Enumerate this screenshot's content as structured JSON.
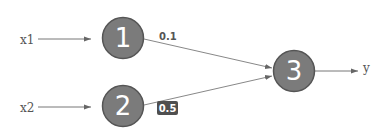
{
  "diagram": {
    "type": "neural-network",
    "colors": {
      "node_fill": "#7b7b7b",
      "node_stroke": "#555555",
      "edge": "#777777",
      "badge_bg": "#4f4f4f",
      "text": "#555555"
    },
    "inputs": [
      {
        "id": "x1",
        "label": "x1"
      },
      {
        "id": "x2",
        "label": "x2"
      }
    ],
    "nodes": [
      {
        "id": "n1",
        "label": "1"
      },
      {
        "id": "n2",
        "label": "2"
      },
      {
        "id": "n3",
        "label": "3"
      }
    ],
    "output": {
      "id": "y",
      "label": "y"
    },
    "edges": [
      {
        "from": "x1",
        "to": "n1",
        "weight": null
      },
      {
        "from": "x2",
        "to": "n2",
        "weight": null
      },
      {
        "from": "n1",
        "to": "n3",
        "weight": "0.1",
        "highlighted": false
      },
      {
        "from": "n2",
        "to": "n3",
        "weight": "0.5",
        "highlighted": true
      },
      {
        "from": "n3",
        "to": "y",
        "weight": null
      }
    ]
  }
}
